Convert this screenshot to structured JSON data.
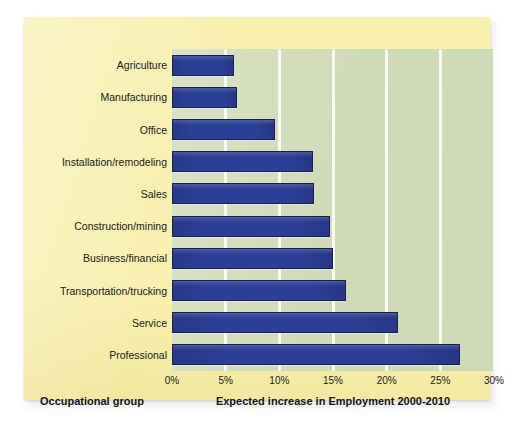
{
  "colors": {
    "card_background": "#f8f0ae",
    "plot_background": "#cfdab6",
    "bar_fill": "#2b3f96",
    "bar_outline": "#18214f",
    "gridline": "#fbfdf6",
    "text": "#1a1a1a",
    "page_background": "#ffffff"
  },
  "axis_titles": {
    "y_title": "Occupational group",
    "x_title": "Expected increase in Employment 2000-2010"
  },
  "chart_data": {
    "type": "bar",
    "orientation": "horizontal",
    "title": "",
    "subtitle": "",
    "xlabel": "Expected increase in Employment 2000-2010",
    "ylabel": "Occupational group",
    "xlim": [
      0,
      30
    ],
    "xticks": [
      0,
      5,
      10,
      15,
      20,
      25,
      30
    ],
    "xtick_labels": [
      "0%",
      "5%",
      "10%",
      "15%",
      "20%",
      "25%",
      "30%"
    ],
    "grid": true,
    "grid_axis": "x",
    "legend": null,
    "units": "percent",
    "categories": [
      "Agriculture",
      "Manufacturing",
      "Office",
      "Installation/remodeling",
      "Sales",
      "Construction/mining",
      "Business/financial",
      "Transportation/trucking",
      "Service",
      "Professional"
    ],
    "values": [
      5.8,
      6.1,
      9.6,
      13.1,
      13.2,
      14.7,
      15.0,
      16.2,
      21.1,
      26.8
    ],
    "series": [
      {
        "name": "Expected increase in Employment 2000-2010",
        "values": [
          5.8,
          6.1,
          9.6,
          13.1,
          13.2,
          14.7,
          15.0,
          16.2,
          21.1,
          26.8
        ]
      }
    ]
  }
}
